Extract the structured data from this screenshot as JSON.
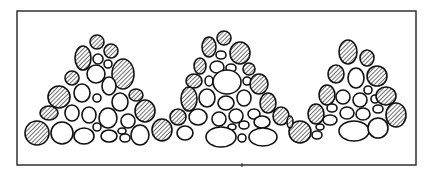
{
  "figure": {
    "width": 431,
    "height": 173,
    "frame": {
      "x": 17,
      "y": 11,
      "width": 399,
      "height": 154
    },
    "tick": {
      "x": 242,
      "y": 165
    },
    "colors": {
      "stroke": "#111111",
      "fill": "#ffffff",
      "hatch": "#222222"
    }
  },
  "piles": [
    {
      "name": "pile-left",
      "stones": [
        {
          "cx": 97,
          "cy": 42,
          "rx": 7,
          "ry": 7,
          "h": true
        },
        {
          "cx": 83,
          "cy": 58,
          "rx": 8,
          "ry": 12,
          "h": true
        },
        {
          "cx": 111,
          "cy": 51,
          "rx": 7,
          "ry": 7,
          "h": true
        },
        {
          "cx": 98,
          "cy": 59,
          "rx": 5,
          "ry": 5,
          "h": false
        },
        {
          "cx": 108,
          "cy": 64,
          "rx": 4,
          "ry": 4,
          "h": false
        },
        {
          "cx": 123,
          "cy": 74,
          "rx": 11,
          "ry": 15,
          "h": true
        },
        {
          "cx": 72,
          "cy": 78,
          "rx": 7,
          "ry": 7,
          "h": true
        },
        {
          "cx": 96,
          "cy": 74,
          "rx": 9,
          "ry": 9,
          "h": false
        },
        {
          "cx": 109,
          "cy": 86,
          "rx": 7,
          "ry": 9,
          "h": false
        },
        {
          "cx": 82,
          "cy": 93,
          "rx": 8,
          "ry": 9,
          "h": false
        },
        {
          "cx": 59,
          "cy": 97,
          "rx": 11,
          "ry": 11,
          "h": true
        },
        {
          "cx": 97,
          "cy": 98,
          "rx": 4,
          "ry": 4,
          "h": false
        },
        {
          "cx": 136,
          "cy": 95,
          "rx": 7,
          "ry": 6,
          "h": true
        },
        {
          "cx": 120,
          "cy": 102,
          "rx": 8,
          "ry": 9,
          "h": false
        },
        {
          "cx": 49,
          "cy": 113,
          "rx": 9,
          "ry": 7,
          "h": true
        },
        {
          "cx": 72,
          "cy": 113,
          "rx": 7,
          "ry": 8,
          "h": false
        },
        {
          "cx": 89,
          "cy": 115,
          "rx": 7,
          "ry": 8,
          "h": false
        },
        {
          "cx": 108,
          "cy": 118,
          "rx": 9,
          "ry": 10,
          "h": false
        },
        {
          "cx": 145,
          "cy": 111,
          "rx": 10,
          "ry": 11,
          "h": true
        },
        {
          "cx": 128,
          "cy": 121,
          "rx": 7,
          "ry": 7,
          "h": false
        },
        {
          "cx": 37,
          "cy": 133,
          "rx": 12,
          "ry": 12,
          "h": true
        },
        {
          "cx": 62,
          "cy": 133,
          "rx": 11,
          "ry": 11,
          "h": false
        },
        {
          "cx": 84,
          "cy": 136,
          "rx": 10,
          "ry": 8,
          "h": false
        },
        {
          "cx": 97,
          "cy": 127,
          "rx": 4,
          "ry": 4,
          "h": false
        },
        {
          "cx": 109,
          "cy": 136,
          "rx": 8,
          "ry": 6,
          "h": false
        },
        {
          "cx": 122,
          "cy": 131,
          "rx": 4,
          "ry": 3,
          "h": false
        },
        {
          "cx": 125,
          "cy": 138,
          "rx": 5,
          "ry": 4,
          "h": false
        },
        {
          "cx": 140,
          "cy": 135,
          "rx": 9,
          "ry": 10,
          "h": false
        },
        {
          "cx": 162,
          "cy": 130,
          "rx": 10,
          "ry": 11,
          "h": true
        }
      ]
    },
    {
      "name": "pile-middle",
      "stones": [
        {
          "cx": 224,
          "cy": 38,
          "rx": 7,
          "ry": 7,
          "h": true
        },
        {
          "cx": 209,
          "cy": 47,
          "rx": 7,
          "ry": 10,
          "h": true
        },
        {
          "cx": 240,
          "cy": 53,
          "rx": 10,
          "ry": 11,
          "h": true
        },
        {
          "cx": 221,
          "cy": 55,
          "rx": 5,
          "ry": 4,
          "h": false
        },
        {
          "cx": 200,
          "cy": 66,
          "rx": 6,
          "ry": 8,
          "h": true
        },
        {
          "cx": 217,
          "cy": 67,
          "rx": 7,
          "ry": 6,
          "h": false
        },
        {
          "cx": 231,
          "cy": 68,
          "rx": 5,
          "ry": 4,
          "h": false
        },
        {
          "cx": 249,
          "cy": 69,
          "rx": 6,
          "ry": 6,
          "h": true
        },
        {
          "cx": 194,
          "cy": 81,
          "rx": 8,
          "ry": 7,
          "h": true
        },
        {
          "cx": 209,
          "cy": 81,
          "rx": 4,
          "ry": 5,
          "h": false
        },
        {
          "cx": 227,
          "cy": 82,
          "rx": 14,
          "ry": 12,
          "h": false
        },
        {
          "cx": 247,
          "cy": 81,
          "rx": 4,
          "ry": 4,
          "h": false
        },
        {
          "cx": 259,
          "cy": 84,
          "rx": 9,
          "ry": 10,
          "h": true
        },
        {
          "cx": 189,
          "cy": 99,
          "rx": 8,
          "ry": 12,
          "h": true
        },
        {
          "cx": 207,
          "cy": 98,
          "rx": 8,
          "ry": 9,
          "h": false
        },
        {
          "cx": 226,
          "cy": 103,
          "rx": 8,
          "ry": 7,
          "h": false
        },
        {
          "cx": 244,
          "cy": 98,
          "rx": 7,
          "ry": 8,
          "h": false
        },
        {
          "cx": 268,
          "cy": 103,
          "rx": 8,
          "ry": 10,
          "h": true
        },
        {
          "cx": 178,
          "cy": 117,
          "rx": 8,
          "ry": 8,
          "h": true
        },
        {
          "cx": 198,
          "cy": 117,
          "rx": 9,
          "ry": 8,
          "h": false
        },
        {
          "cx": 219,
          "cy": 119,
          "rx": 7,
          "ry": 7,
          "h": false
        },
        {
          "cx": 236,
          "cy": 116,
          "rx": 7,
          "ry": 7,
          "h": false
        },
        {
          "cx": 254,
          "cy": 114,
          "rx": 6,
          "ry": 5,
          "h": false
        },
        {
          "cx": 281,
          "cy": 116,
          "rx": 8,
          "ry": 9,
          "h": true
        },
        {
          "cx": 232,
          "cy": 127,
          "rx": 4,
          "ry": 3,
          "h": false
        },
        {
          "cx": 244,
          "cy": 125,
          "rx": 5,
          "ry": 4,
          "h": false
        },
        {
          "cx": 262,
          "cy": 122,
          "rx": 8,
          "ry": 6,
          "h": false
        },
        {
          "cx": 185,
          "cy": 133,
          "rx": 8,
          "ry": 7,
          "h": false
        },
        {
          "cx": 221,
          "cy": 137,
          "rx": 15,
          "ry": 10,
          "h": false
        },
        {
          "cx": 242,
          "cy": 138,
          "rx": 4,
          "ry": 4,
          "h": false
        },
        {
          "cx": 263,
          "cy": 137,
          "rx": 14,
          "ry": 9,
          "h": false
        }
      ]
    },
    {
      "name": "pile-right",
      "stones": [
        {
          "cx": 348,
          "cy": 52,
          "rx": 9,
          "ry": 12,
          "h": true
        },
        {
          "cx": 367,
          "cy": 58,
          "rx": 7,
          "ry": 8,
          "h": true
        },
        {
          "cx": 336,
          "cy": 74,
          "rx": 8,
          "ry": 9,
          "h": true
        },
        {
          "cx": 356,
          "cy": 78,
          "rx": 8,
          "ry": 10,
          "h": false
        },
        {
          "cx": 377,
          "cy": 76,
          "rx": 10,
          "ry": 10,
          "h": true
        },
        {
          "cx": 368,
          "cy": 90,
          "rx": 4,
          "ry": 4,
          "h": false
        },
        {
          "cx": 327,
          "cy": 95,
          "rx": 8,
          "ry": 10,
          "h": true
        },
        {
          "cx": 343,
          "cy": 97,
          "rx": 7,
          "ry": 7,
          "h": false
        },
        {
          "cx": 360,
          "cy": 100,
          "rx": 7,
          "ry": 7,
          "h": false
        },
        {
          "cx": 375,
          "cy": 99,
          "rx": 4,
          "ry": 4,
          "h": false
        },
        {
          "cx": 386,
          "cy": 96,
          "rx": 10,
          "ry": 9,
          "h": true
        },
        {
          "cx": 332,
          "cy": 108,
          "rx": 5,
          "ry": 4,
          "h": false
        },
        {
          "cx": 347,
          "cy": 113,
          "rx": 7,
          "ry": 6,
          "h": false
        },
        {
          "cx": 363,
          "cy": 114,
          "rx": 7,
          "ry": 6,
          "h": false
        },
        {
          "cx": 378,
          "cy": 109,
          "rx": 5,
          "ry": 4,
          "h": false
        },
        {
          "cx": 316,
          "cy": 114,
          "rx": 8,
          "ry": 10,
          "h": true
        },
        {
          "cx": 396,
          "cy": 115,
          "rx": 10,
          "ry": 12,
          "h": true
        },
        {
          "cx": 330,
          "cy": 120,
          "rx": 7,
          "ry": 5,
          "h": false
        },
        {
          "cx": 320,
          "cy": 127,
          "rx": 4,
          "ry": 3,
          "h": false
        },
        {
          "cx": 354,
          "cy": 131,
          "rx": 15,
          "ry": 10,
          "h": false
        },
        {
          "cx": 378,
          "cy": 128,
          "rx": 10,
          "ry": 10,
          "h": false
        },
        {
          "cx": 317,
          "cy": 135,
          "rx": 5,
          "ry": 4,
          "h": false
        },
        {
          "cx": 300,
          "cy": 132,
          "rx": 11,
          "ry": 11,
          "h": true
        },
        {
          "cx": 290,
          "cy": 122,
          "rx": 3,
          "ry": 6,
          "h": true
        }
      ]
    }
  ]
}
